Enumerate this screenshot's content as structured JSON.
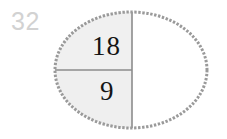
{
  "page": {
    "background_color": "#ffffff",
    "width": 227,
    "height": 139
  },
  "problem": {
    "number": "32",
    "number_color": "#d2d2d2"
  },
  "figure": {
    "shape_name": "ellipse",
    "outline_color": "#9a9a9a",
    "outline_style": "dashed",
    "outline_width": 3,
    "fill_shaded_color": "#f0f0f0",
    "fill_unshaded_color": "#ffffff",
    "divider_color": "#8c8c8c",
    "center_x": 131,
    "center_y": 70,
    "radius_x": 76,
    "radius_y": 58,
    "vertical_divider_x": 132,
    "horizontal_divider_y": 70,
    "regions": [
      {
        "name": "upper-left-region",
        "label": "18",
        "shaded": true
      },
      {
        "name": "lower-left-region",
        "label": "9",
        "shaded": true
      },
      {
        "name": "right-region",
        "label": "",
        "shaded": false
      }
    ]
  },
  "labels": {
    "top": "18",
    "bottom": "9"
  }
}
